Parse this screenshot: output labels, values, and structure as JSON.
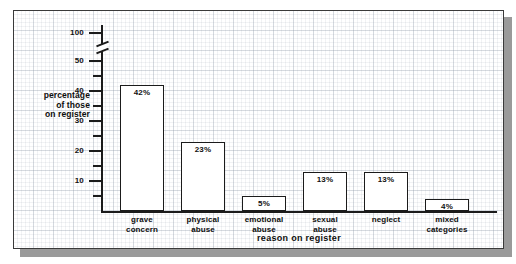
{
  "chart_data": {
    "type": "bar",
    "title": "",
    "xlabel": "reason on register",
    "ylabel": "percentage\nof those\non register",
    "ylabel_lines": [
      "percentage",
      "of those",
      "on register"
    ],
    "categories": [
      "grave concern",
      "physical abuse",
      "emotional abuse",
      "sexual abuse",
      "neglect",
      "mixed categories"
    ],
    "category_lines": [
      [
        "grave",
        "concern"
      ],
      [
        "physical",
        "abuse"
      ],
      [
        "emotional",
        "abuse"
      ],
      [
        "sexual",
        "abuse"
      ],
      [
        "neglect"
      ],
      [
        "mixed",
        "categories"
      ]
    ],
    "values": [
      42,
      23,
      5,
      13,
      13,
      4
    ],
    "value_labels": [
      "42%",
      "23%",
      "5%",
      "13%",
      "13%",
      "4%"
    ],
    "ylim": [
      0,
      50
    ],
    "y_major_ticks": [
      10,
      20,
      30,
      40,
      50
    ],
    "y_major_tick_labels": [
      "10",
      "20",
      "30",
      "40",
      "50"
    ],
    "y_minor_ticks": [
      5,
      15,
      25,
      35,
      45
    ],
    "y_top_tick": 100,
    "y_top_tick_label": "100",
    "axis_break": true,
    "axis_break_between": [
      50,
      100
    ],
    "grid": true,
    "grid_style": "graph-paper",
    "legend": null,
    "bar_fill": "#ffffff",
    "bar_edge": "#1b1b1b",
    "axis_color": "#1b1b1b",
    "grid_color": "#96a0af",
    "frame_color": "#3a3a3a",
    "shadow_color": "#9a9a9a",
    "background": "#ffffff"
  }
}
